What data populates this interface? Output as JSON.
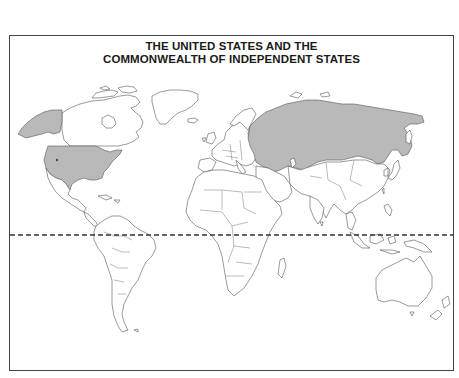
{
  "map": {
    "title_line1": "THE UNITED STATES AND THE",
    "title_line2": "COMMONWEALTH OF INDEPENDENT STATES",
    "highlighted_regions": [
      "United States",
      "Commonwealth of Independent States"
    ],
    "highlight_color": "#b9b9b9",
    "outline_color": "#555555",
    "equator_style": "dashed",
    "projection": "world outline map"
  }
}
